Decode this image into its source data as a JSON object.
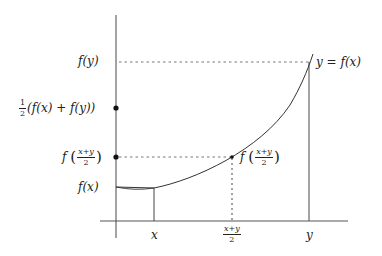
{
  "diagram": {
    "type": "convex-function-midpoint-illustration",
    "curve_label": "y = f(x)",
    "y_axis_labels": {
      "f_y": "f(y)",
      "half_sum_prefix_num": "1",
      "half_sum_prefix_den": "2",
      "half_sum_body": "(f(x) + f(y))",
      "f_mid_f": "f",
      "f_mid_num": "x+y",
      "f_mid_den": "2",
      "f_x": "f(x)"
    },
    "x_axis_labels": {
      "x": "x",
      "mid_num": "x+y",
      "mid_den": "2",
      "y": "y"
    },
    "point_label": {
      "f": "f",
      "num": "x+y",
      "den": "2"
    },
    "colors": {
      "axis": "#555555",
      "curve": "#333333",
      "dashed": "#555555",
      "dot": "#111111",
      "text": "#222222"
    }
  }
}
